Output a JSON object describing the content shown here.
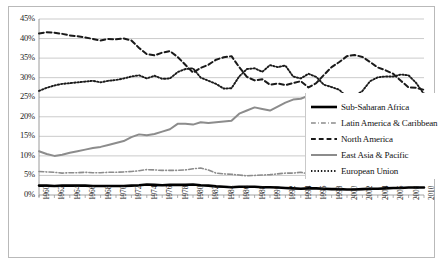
{
  "chart_data": {
    "type": "line",
    "title": "",
    "xlabel": "",
    "ylabel": "",
    "ylim": [
      0,
      45
    ],
    "ytick_labels": [
      "0%",
      "5%",
      "10%",
      "15%",
      "20%",
      "25%",
      "30%",
      "35%",
      "40%",
      "45%"
    ],
    "ytick_values": [
      0,
      5,
      10,
      15,
      20,
      25,
      30,
      35,
      40,
      45
    ],
    "grid": true,
    "legend_position": "right",
    "x_tick_labels": [
      "1960",
      "1962",
      "1964",
      "1966",
      "1968",
      "1970",
      "1972",
      "1974",
      "1976",
      "1978",
      "1980",
      "1982",
      "1984",
      "1986",
      "1988",
      "1990",
      "1992",
      "1994",
      "1996",
      "1998",
      "2000",
      "2002",
      "2004",
      "2006",
      "2008",
      "2010"
    ],
    "x": [
      1960,
      1961,
      1962,
      1963,
      1964,
      1965,
      1966,
      1967,
      1968,
      1969,
      1970,
      1971,
      1972,
      1973,
      1974,
      1975,
      1976,
      1977,
      1978,
      1979,
      1980,
      1981,
      1982,
      1983,
      1984,
      1985,
      1986,
      1987,
      1988,
      1989,
      1990,
      1991,
      1992,
      1993,
      1994,
      1995,
      1996,
      1997,
      1998,
      1999,
      2000,
      2001,
      2002,
      2003,
      2004,
      2005,
      2006,
      2007,
      2008,
      2009,
      2010
    ],
    "xlim": [
      1960,
      2010
    ],
    "series": [
      {
        "name": "Sub-Saharan Africa",
        "color": "#000000",
        "style": "solid",
        "width": 2.6,
        "values": [
          2.4,
          2.4,
          2.3,
          2.4,
          2.4,
          2.4,
          2.4,
          2.3,
          2.3,
          2.3,
          2.3,
          2.3,
          2.4,
          2.5,
          2.7,
          2.6,
          2.5,
          2.6,
          2.6,
          2.6,
          2.7,
          2.5,
          2.4,
          2.2,
          2.1,
          2.0,
          2.1,
          2.1,
          2.1,
          2.0,
          2.0,
          1.9,
          1.8,
          1.7,
          1.6,
          1.7,
          1.7,
          1.6,
          1.5,
          1.5,
          1.4,
          1.4,
          1.5,
          1.6,
          1.6,
          1.7,
          1.8,
          1.8,
          1.9,
          1.9,
          1.9
        ]
      },
      {
        "name": "Latin America & Caribbean",
        "color": "#8c8c8c",
        "style": "dashdot",
        "width": 1.6,
        "values": [
          6.0,
          5.9,
          5.8,
          5.6,
          5.7,
          5.7,
          5.8,
          5.7,
          5.7,
          5.8,
          5.8,
          5.9,
          6.0,
          6.2,
          6.5,
          6.4,
          6.3,
          6.3,
          6.3,
          6.4,
          6.7,
          6.9,
          6.4,
          5.6,
          5.4,
          5.3,
          5.1,
          4.9,
          5.0,
          5.1,
          5.2,
          5.4,
          5.6,
          5.6,
          5.8,
          5.4,
          5.6,
          5.9,
          5.8,
          5.2,
          5.4,
          5.3,
          4.7,
          4.4,
          4.6,
          5.0,
          5.3,
          5.6,
          5.9,
          5.9,
          6.7
        ]
      },
      {
        "name": "North America",
        "color": "#1a1a1a",
        "style": "dashed",
        "width": 2.0,
        "values": [
          41.3,
          41.6,
          41.5,
          41.2,
          40.8,
          40.6,
          40.3,
          39.9,
          39.5,
          39.9,
          39.8,
          40.0,
          39.5,
          37.6,
          36.0,
          35.7,
          36.4,
          36.8,
          35.3,
          33.3,
          31.3,
          32.5,
          33.3,
          34.6,
          35.2,
          35.5,
          32.7,
          30.2,
          29.3,
          29.6,
          28.2,
          28.5,
          28.1,
          28.6,
          29.1,
          27.5,
          28.6,
          30.7,
          32.7,
          34.0,
          35.5,
          35.8,
          35.3,
          34.0,
          32.6,
          31.9,
          31.0,
          29.2,
          27.5,
          27.4,
          26.9
        ]
      },
      {
        "name": "East Asia & Pacific",
        "color": "#8c8c8c",
        "style": "solid",
        "width": 2.0,
        "values": [
          11.2,
          10.5,
          10.0,
          10.3,
          10.8,
          11.2,
          11.6,
          12.0,
          12.3,
          12.8,
          13.3,
          13.8,
          14.8,
          15.5,
          15.3,
          15.6,
          16.2,
          16.8,
          18.2,
          18.2,
          18.0,
          18.6,
          18.4,
          18.6,
          18.8,
          19.0,
          20.8,
          21.6,
          22.4,
          22.0,
          21.6,
          22.6,
          23.6,
          24.4,
          24.6,
          25.4,
          24.8,
          23.7,
          21.6,
          22.4,
          23.0,
          22.1,
          22.0,
          22.0,
          22.3,
          22.2,
          22.4,
          23.0,
          24.0,
          24.9,
          26.0
        ]
      },
      {
        "name": "European Union",
        "color": "#1a1a1a",
        "style": "dotted",
        "width": 1.9,
        "values": [
          26.6,
          27.4,
          28.0,
          28.4,
          28.6,
          28.8,
          29.0,
          29.2,
          28.8,
          29.2,
          29.4,
          29.8,
          30.3,
          30.6,
          29.8,
          30.5,
          29.7,
          29.8,
          31.4,
          32.2,
          32.4,
          30.0,
          29.2,
          28.4,
          27.2,
          27.3,
          30.3,
          32.2,
          32.4,
          31.5,
          33.2,
          32.7,
          33.1,
          30.3,
          29.8,
          31.0,
          30.2,
          28.2,
          27.6,
          26.9,
          25.0,
          25.3,
          26.6,
          29.1,
          30.1,
          30.3,
          30.3,
          30.8,
          30.6,
          28.6,
          25.8
        ]
      }
    ]
  },
  "legend": {
    "items": [
      {
        "label": "Sub-Saharan Africa"
      },
      {
        "label": "Latin America & Caribbean"
      },
      {
        "label": "North America"
      },
      {
        "label": "East Asia & Pacific"
      },
      {
        "label": "European Union"
      }
    ]
  }
}
